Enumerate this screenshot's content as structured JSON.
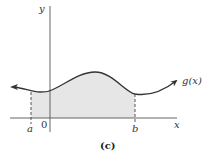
{
  "figure": {
    "caption": "(c)",
    "function_label": "g(x)",
    "axes": {
      "x_label": "x",
      "y_label": "y",
      "origin_label": "0"
    },
    "bounds": {
      "lower_label": "a",
      "upper_label": "b"
    },
    "colors": {
      "curve": "#333333",
      "axes": "#555555",
      "shaded_region": "#e6e6e6",
      "dashed_lines": "#444444"
    }
  }
}
